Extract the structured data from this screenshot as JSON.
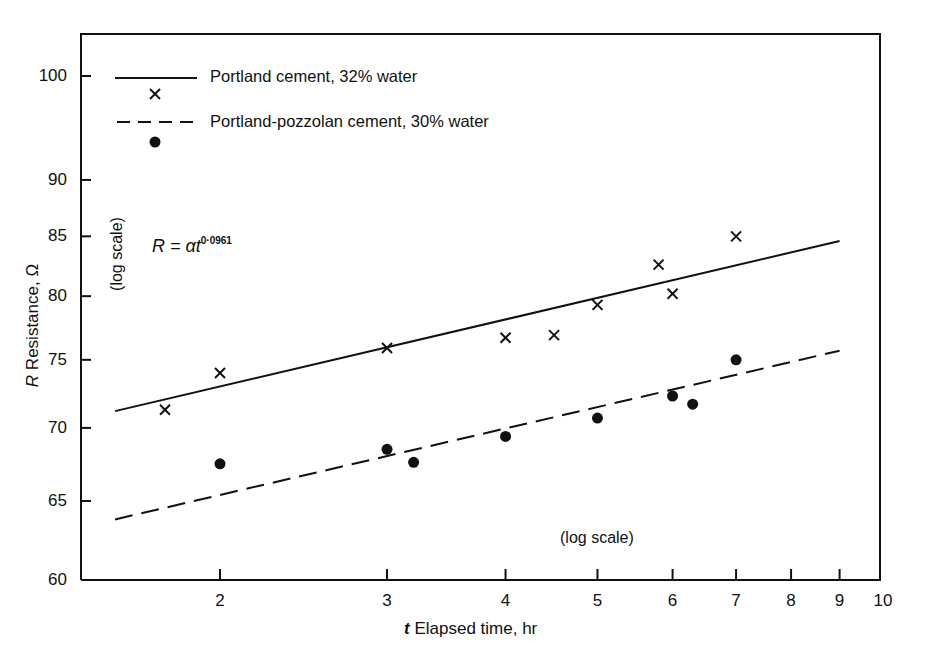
{
  "chart_data": {
    "type": "scatter",
    "title": "",
    "xlabel_italic": "t",
    "xlabel": "Elapsed time, hr",
    "ylabel_italic": "R",
    "ylabel": "Resistance, Ω",
    "x_scale": "log",
    "y_scale": "log",
    "x_scale_note": "(log scale)",
    "y_scale_note": "(log scale)",
    "xlim": [
      1.5,
      10
    ],
    "ylim": [
      60,
      105
    ],
    "x_ticks": [
      "2",
      "3",
      "4",
      "5",
      "6",
      "7",
      "8",
      "9",
      "10"
    ],
    "y_ticks": [
      "60",
      "65",
      "70",
      "75",
      "80",
      "85",
      "90",
      "100"
    ],
    "grid": false,
    "legend_position": "upper-left",
    "equation": {
      "lhs": "R = αt",
      "exponent": "0·0961"
    },
    "series": [
      {
        "name": "Portland cement, 32% water",
        "marker": "x",
        "line_style": "solid",
        "points": [
          {
            "x": 1.75,
            "y": 71.3
          },
          {
            "x": 2.0,
            "y": 74.0
          },
          {
            "x": 3.0,
            "y": 75.9
          },
          {
            "x": 4.0,
            "y": 76.7
          },
          {
            "x": 4.5,
            "y": 76.9
          },
          {
            "x": 5.0,
            "y": 79.3
          },
          {
            "x": 5.8,
            "y": 82.6
          },
          {
            "x": 6.0,
            "y": 80.2
          },
          {
            "x": 7.0,
            "y": 85.0
          }
        ],
        "fit": {
          "x": [
            1.55,
            9.0
          ],
          "y": [
            71.2,
            84.6
          ]
        }
      },
      {
        "name": "Portland-pozzolan cement, 30% water",
        "marker": "dot",
        "line_style": "dashed",
        "points": [
          {
            "x": 2.0,
            "y": 67.5
          },
          {
            "x": 3.0,
            "y": 68.5
          },
          {
            "x": 3.2,
            "y": 67.6
          },
          {
            "x": 4.0,
            "y": 69.4
          },
          {
            "x": 5.0,
            "y": 70.7
          },
          {
            "x": 6.0,
            "y": 72.3
          },
          {
            "x": 6.3,
            "y": 71.7
          },
          {
            "x": 7.0,
            "y": 75.0
          }
        ],
        "fit": {
          "x": [
            1.55,
            9.0
          ],
          "y": [
            63.8,
            75.7
          ]
        }
      }
    ]
  },
  "colors": {
    "ink": "#111111",
    "background": "#ffffff"
  }
}
